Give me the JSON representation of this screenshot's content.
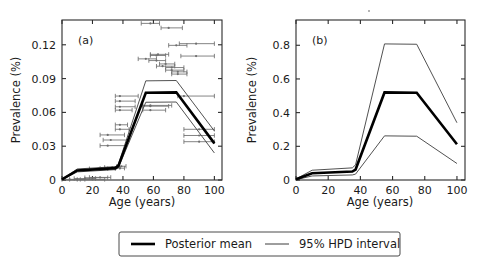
{
  "figure": {
    "background_color": "#ffffff",
    "mean_color": "#000000",
    "hpd_color": "#3d3d3d",
    "errorbar_color": "#6e6e6e"
  },
  "legend": {
    "mean_label": "Posterior mean",
    "hpd_label": "95% HPD interval"
  },
  "panels": {
    "a": {
      "tag": "(a)"
    },
    "b": {
      "tag": "(b)"
    }
  },
  "chart_data": [
    {
      "type": "line",
      "title": "(a)",
      "xlabel": "Age (years)",
      "ylabel": "Prevalence (%)",
      "xlim": [
        0,
        105
      ],
      "ylim": [
        0,
        0.142
      ],
      "xticks": [
        0,
        20,
        40,
        60,
        80,
        100
      ],
      "xticklabels": [
        "0",
        "20",
        "40",
        "60",
        "80",
        "100"
      ],
      "yticks": [
        0,
        0.03,
        0.06,
        0.09,
        0.12
      ],
      "yticklabels": [
        "0",
        "0.03",
        "0.06",
        "0.09",
        "0.12"
      ],
      "grid": false,
      "legend_position": "below-figure",
      "x": [
        0,
        10,
        35,
        37,
        55,
        75,
        100
      ],
      "series": [
        {
          "name": "Posterior mean",
          "style": "thick",
          "values": [
            0.0005,
            0.0085,
            0.0105,
            0.0125,
            0.0775,
            0.0778,
            0.0325
          ]
        },
        {
          "name": "95% HPD upper",
          "style": "thin",
          "values": [
            0.0008,
            0.0098,
            0.0118,
            0.014,
            0.088,
            0.0883,
            0.0435
          ]
        },
        {
          "name": "95% HPD lower",
          "style": "thin",
          "values": [
            0.0003,
            0.0072,
            0.0092,
            0.011,
            0.069,
            0.0692,
            0.024
          ]
        }
      ],
      "observations": [
        {
          "age": 5,
          "value": 0.0005,
          "age_low": 0,
          "age_high": 10
        },
        {
          "age": 10,
          "value": 0.0005,
          "age_low": 5,
          "age_high": 15
        },
        {
          "age": 15,
          "value": 0.0013,
          "age_low": 8,
          "age_high": 22
        },
        {
          "age": 20,
          "value": 0.0005,
          "age_low": 12,
          "age_high": 28
        },
        {
          "age": 22,
          "value": 0.002,
          "age_low": 15,
          "age_high": 30
        },
        {
          "age": 25,
          "value": 0.0023,
          "age_low": 18,
          "age_high": 32
        },
        {
          "age": 24,
          "value": 0.01,
          "age_low": 18,
          "age_high": 30
        },
        {
          "age": 30,
          "value": 0.0103,
          "age_low": 25,
          "age_high": 35
        },
        {
          "age": 33,
          "value": 0.0112,
          "age_low": 28,
          "age_high": 38
        },
        {
          "age": 38,
          "value": 0.0105,
          "age_low": 35,
          "age_high": 41
        },
        {
          "age": 39,
          "value": 0.0122,
          "age_low": 36,
          "age_high": 42
        },
        {
          "age": 30,
          "value": 0.0305,
          "age_low": 25,
          "age_high": 42
        },
        {
          "age": 32,
          "value": 0.0355,
          "age_low": 27,
          "age_high": 44
        },
        {
          "age": 30,
          "value": 0.04,
          "age_low": 25,
          "age_high": 41
        },
        {
          "age": 38,
          "value": 0.045,
          "age_low": 35,
          "age_high": 44
        },
        {
          "age": 38,
          "value": 0.049,
          "age_low": 35,
          "age_high": 43
        },
        {
          "age": 38,
          "value": 0.062,
          "age_low": 35,
          "age_high": 46
        },
        {
          "age": 38,
          "value": 0.065,
          "age_low": 35,
          "age_high": 48
        },
        {
          "age": 38,
          "value": 0.07,
          "age_low": 35,
          "age_high": 48
        },
        {
          "age": 38,
          "value": 0.0745,
          "age_low": 35,
          "age_high": 50
        },
        {
          "age": 58,
          "value": 0.062,
          "age_low": 53,
          "age_high": 68
        },
        {
          "age": 58,
          "value": 0.0655,
          "age_low": 53,
          "age_high": 70
        },
        {
          "age": 58,
          "value": 0.0662,
          "age_low": 53,
          "age_high": 72
        },
        {
          "age": 80,
          "value": 0.0745,
          "age_low": 76,
          "age_high": 100
        },
        {
          "age": 76,
          "value": 0.094,
          "age_low": 72,
          "age_high": 82
        },
        {
          "age": 76,
          "value": 0.096,
          "age_low": 72,
          "age_high": 82
        },
        {
          "age": 72,
          "value": 0.0975,
          "age_low": 68,
          "age_high": 80
        },
        {
          "age": 72,
          "value": 0.0998,
          "age_low": 68,
          "age_high": 80
        },
        {
          "age": 66,
          "value": 0.101,
          "age_low": 62,
          "age_high": 74
        },
        {
          "age": 68,
          "value": 0.103,
          "age_low": 64,
          "age_high": 74
        },
        {
          "age": 62,
          "value": 0.106,
          "age_low": 57,
          "age_high": 68
        },
        {
          "age": 55,
          "value": 0.1075,
          "age_low": 50,
          "age_high": 62
        },
        {
          "age": 62,
          "value": 0.1105,
          "age_low": 58,
          "age_high": 68
        },
        {
          "age": 63,
          "value": 0.1115,
          "age_low": 58,
          "age_high": 70
        },
        {
          "age": 88,
          "value": 0.11,
          "age_low": 78,
          "age_high": 100
        },
        {
          "age": 88,
          "value": 0.121,
          "age_low": 77,
          "age_high": 100
        },
        {
          "age": 75,
          "value": 0.1195,
          "age_low": 70,
          "age_high": 82
        },
        {
          "age": 70,
          "value": 0.135,
          "age_low": 65,
          "age_high": 79
        },
        {
          "age": 58,
          "value": 0.139,
          "age_low": 52,
          "age_high": 64
        },
        {
          "age": 90,
          "value": 0.045,
          "age_low": 80,
          "age_high": 100
        },
        {
          "age": 90,
          "value": 0.0395,
          "age_low": 80,
          "age_high": 100
        },
        {
          "age": 90,
          "value": 0.034,
          "age_low": 80,
          "age_high": 100
        }
      ]
    },
    {
      "type": "line",
      "title": "(b)",
      "xlabel": "Age (years)",
      "ylabel": "Prevalence (%)",
      "xlim": [
        0,
        105
      ],
      "ylim": [
        0,
        0.95
      ],
      "xticks": [
        0,
        20,
        40,
        60,
        80,
        100
      ],
      "xticklabels": [
        "0",
        "20",
        "40",
        "60",
        "80",
        "100"
      ],
      "yticks": [
        0,
        0.2,
        0.4,
        0.6,
        0.8
      ],
      "yticklabels": [
        "0",
        "0.2",
        "0.4",
        "0.6",
        "0.8"
      ],
      "grid": false,
      "legend_position": "below-figure",
      "x": [
        0,
        10,
        35,
        37,
        55,
        75,
        100
      ],
      "series": [
        {
          "name": "Posterior mean",
          "style": "thick",
          "values": [
            0.004,
            0.04,
            0.05,
            0.062,
            0.52,
            0.518,
            0.212
          ]
        },
        {
          "name": "95% HPD upper",
          "style": "thin",
          "values": [
            0.006,
            0.058,
            0.072,
            0.09,
            0.808,
            0.806,
            0.34
          ]
        },
        {
          "name": "95% HPD lower",
          "style": "thin",
          "values": [
            0.002,
            0.024,
            0.03,
            0.035,
            0.262,
            0.26,
            0.098
          ]
        }
      ],
      "observations": []
    }
  ]
}
